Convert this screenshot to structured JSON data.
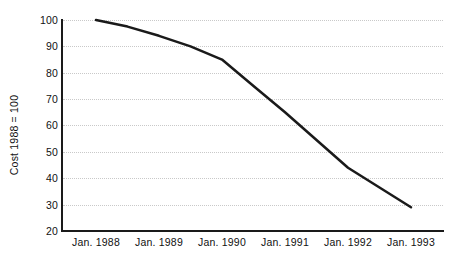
{
  "chart_data": {
    "type": "line",
    "title": "",
    "xlabel": "",
    "ylabel": "Cost 1988 = 100",
    "categories": [
      "Jan. 1988",
      "Jan. 1989",
      "Jan. 1990",
      "Jan. 1991",
      "Jan. 1992",
      "Jan. 1993"
    ],
    "x_tick_labels": [
      "Jan. 1988",
      "Jan. 1989",
      "Jan. 1990",
      "Jan. 1991",
      "Jan. 1992",
      "Jan. 1993"
    ],
    "y_tick_labels": [
      "100",
      "90",
      "80",
      "70",
      "60",
      "50",
      "40",
      "30",
      "20"
    ],
    "y_ticks": [
      100,
      90,
      80,
      70,
      60,
      50,
      40,
      30,
      20
    ],
    "ylim": [
      20,
      100
    ],
    "grid": "horizontal-dotted",
    "legend": "none",
    "series": [
      {
        "name": "Cost index",
        "color": "#1a1a1a",
        "line_width": 2.5,
        "markers": "none",
        "values": [
          100,
          94,
          85,
          65,
          44,
          29
        ],
        "points": [
          {
            "x": "Jan. 1988",
            "y": 100
          },
          {
            "x": "Jan. 1988.5",
            "y": 97.5
          },
          {
            "x": "Jan. 1989",
            "y": 94
          },
          {
            "x": "Jan. 1989.5",
            "y": 90
          },
          {
            "x": "Jan. 1990",
            "y": 85
          },
          {
            "x": "Jan. 1990.5",
            "y": 75
          },
          {
            "x": "Jan. 1991",
            "y": 65
          },
          {
            "x": "Jan. 1991.5",
            "y": 54.5
          },
          {
            "x": "Jan. 1992",
            "y": 44
          },
          {
            "x": "Jan. 1992.5",
            "y": 36.5
          },
          {
            "x": "Jan. 1993",
            "y": 29
          }
        ]
      }
    ]
  },
  "axes": {
    "y_title": "Cost 1988 = 100",
    "y_tick_labels": [
      "100",
      "90",
      "80",
      "70",
      "60",
      "50",
      "40",
      "30",
      "20"
    ],
    "x_tick_labels": [
      "Jan. 1988",
      "Jan. 1989",
      "Jan. 1990",
      "Jan. 1991",
      "Jan. 1992",
      "Jan. 1993"
    ]
  },
  "colors": {
    "line": "#1a1a1a",
    "axis": "#1a1a1a",
    "grid": "#c9c9c9",
    "background": "#ffffff",
    "text": "#111111"
  }
}
